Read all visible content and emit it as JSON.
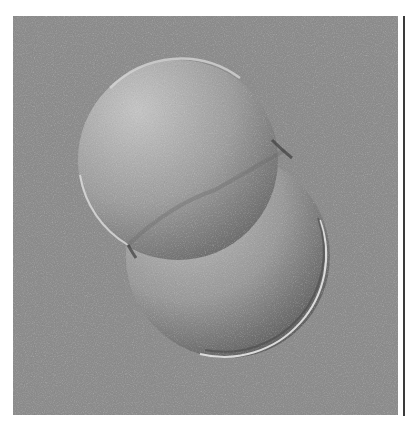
{
  "image": {
    "subject": "two-cell embryo (DIC micrograph)",
    "colors": {
      "background": "#8d8d8d",
      "cell_light": "#c2c2c2",
      "cell_mid": "#9a9a9a",
      "cell_dark": "#5a5a5a",
      "rim": "#d8d8d8",
      "page": "#ffffff",
      "edge_rule": "#3a3a3a"
    },
    "frame": {
      "x": 13,
      "y": 16,
      "width": 385,
      "height": 399
    },
    "blastomeres": [
      {
        "name": "upper-left",
        "cx": 178,
        "cy": 160,
        "r": 100
      },
      {
        "name": "lower-right",
        "cx": 228,
        "cy": 256,
        "r": 102
      }
    ]
  }
}
